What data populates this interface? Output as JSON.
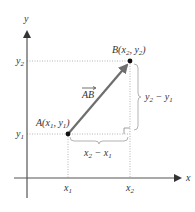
{
  "diagram": {
    "axes": {
      "x_label": "x",
      "y_label": "y"
    },
    "ticks": {
      "x1": "x",
      "x1_sub": "1",
      "x2": "x",
      "x2_sub": "2",
      "y1": "y",
      "y1_sub": "1",
      "y2": "y",
      "y2_sub": "2"
    },
    "points": {
      "A": {
        "name": "A",
        "label_pre": "A(x",
        "s1": "1",
        "mid": ", y",
        "s2": "1",
        "post": ")"
      },
      "B": {
        "name": "B",
        "label_pre": "B(x",
        "s1": "2",
        "mid": ", y",
        "s2": "2",
        "post": ")"
      }
    },
    "vector_label": "AB",
    "brackets": {
      "horizontal": {
        "a": "x",
        "a_sub": "2",
        "op": " − ",
        "b": "x",
        "b_sub": "1"
      },
      "vertical": {
        "a": "y",
        "a_sub": "2",
        "op": " − ",
        "b": "y",
        "b_sub": "1"
      }
    },
    "colors": {
      "axis": "#555555",
      "vector": "#6e6e6e",
      "dotted": "#b0b0b0",
      "bracket": "#aaaaaa",
      "point": "#111111",
      "text": "#333333"
    }
  }
}
